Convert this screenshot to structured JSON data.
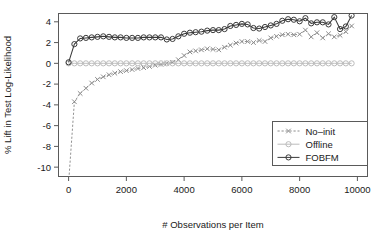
{
  "chart_data": {
    "type": "line",
    "title": "",
    "xlabel": "# Observations per Item",
    "ylabel": "% Lift in Test Log-Likelihood",
    "xlim": [
      -350,
      10350
    ],
    "ylim": [
      -10.9,
      4.8
    ],
    "xticks": [
      0,
      2000,
      4000,
      6000,
      8000,
      10000
    ],
    "xticklabels": [
      "0",
      "2000",
      "4000",
      "6000",
      "8000",
      "10000"
    ],
    "yticks": [
      4,
      2,
      0,
      -2,
      -4,
      -6,
      -8,
      -10
    ],
    "yticklabels": [
      "4",
      "2",
      "0",
      "-2",
      "-4",
      "-6",
      "-8",
      "-10"
    ],
    "grid": false,
    "legend_position": "bottom-right",
    "x": [
      0,
      200,
      400,
      600,
      800,
      1000,
      1200,
      1400,
      1600,
      1800,
      2000,
      2200,
      2400,
      2600,
      2800,
      3000,
      3200,
      3400,
      3600,
      3800,
      4000,
      4200,
      4400,
      4600,
      4800,
      5000,
      5200,
      5400,
      5600,
      5800,
      6000,
      6200,
      6400,
      6600,
      6800,
      7000,
      7200,
      7400,
      7600,
      7800,
      8000,
      8200,
      8400,
      8600,
      8800,
      9000,
      9200,
      9400,
      9600,
      9800
    ],
    "series": [
      {
        "name": "No-init",
        "marker": "x-cross",
        "linestyle": "dashed",
        "color": "#8c8c8c",
        "values": [
          -11.5,
          -3.7,
          -2.9,
          -2.4,
          -1.9,
          -1.55,
          -1.3,
          -1.1,
          -0.95,
          -0.8,
          -0.7,
          -0.6,
          -0.5,
          -0.42,
          -0.3,
          -0.18,
          -0.1,
          0.0,
          0.1,
          0.35,
          0.75,
          1.1,
          1.2,
          1.3,
          1.4,
          1.35,
          1.3,
          1.55,
          1.75,
          1.95,
          2.1,
          2.1,
          2.0,
          2.2,
          2.1,
          2.45,
          2.6,
          2.75,
          2.8,
          2.75,
          2.8,
          3.2,
          2.55,
          2.95,
          2.45,
          2.85,
          2.55,
          2.7,
          3.05,
          3.6
        ]
      },
      {
        "name": "Offline",
        "marker": "circle",
        "linestyle": "solid",
        "color": "#bcbcbc",
        "values": [
          0,
          0,
          0,
          0,
          0,
          0,
          0,
          0,
          0,
          0,
          0,
          0,
          0,
          0,
          0,
          0,
          0,
          0,
          0,
          0,
          0,
          0,
          0,
          0,
          0,
          0,
          0,
          0,
          0,
          0,
          0,
          0,
          0,
          0,
          0,
          0,
          0,
          0,
          0,
          0,
          0,
          0,
          0,
          0,
          0,
          0,
          0,
          0,
          0,
          0
        ]
      },
      {
        "name": "FOBFM",
        "marker": "circle",
        "linestyle": "solid",
        "color": "#3a3a3a",
        "values": [
          0.1,
          1.85,
          2.4,
          2.45,
          2.5,
          2.55,
          2.6,
          2.55,
          2.5,
          2.5,
          2.45,
          2.45,
          2.45,
          2.5,
          2.5,
          2.5,
          2.5,
          2.3,
          2.35,
          2.6,
          2.85,
          2.95,
          3.0,
          3.05,
          3.15,
          3.2,
          3.2,
          3.3,
          3.6,
          3.7,
          3.8,
          3.75,
          3.4,
          3.35,
          3.5,
          3.65,
          3.8,
          4.1,
          4.25,
          4.2,
          4.05,
          4.35,
          3.85,
          3.95,
          3.95,
          3.75,
          4.45,
          3.3,
          3.55,
          4.6
        ]
      }
    ]
  },
  "legend": {
    "entries": [
      {
        "label": "No–init"
      },
      {
        "label": "Offline"
      },
      {
        "label": "FOBFM"
      }
    ]
  }
}
